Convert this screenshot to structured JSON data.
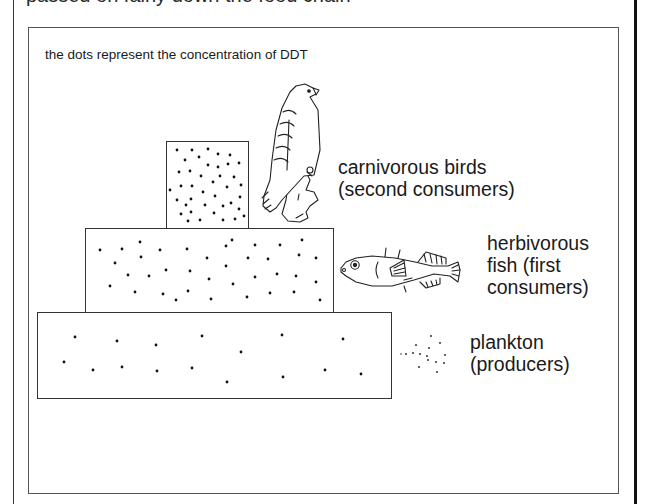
{
  "header": {
    "clipped_text": "passed on fairly down the food chain"
  },
  "diagram": {
    "caption": "the dots represent the concentration of DDT",
    "levels": [
      {
        "id": "carnivorous-birds",
        "label_line1": "carnivorous birds",
        "label_line2": "(second consumers)",
        "label_line3": "",
        "organism_icon": "bird-icon",
        "dot_count": 40,
        "box": {
          "x": 166,
          "y": 141,
          "w": 83,
          "h": 88
        }
      },
      {
        "id": "herbivorous-fish",
        "label_line1": "herbivorous",
        "label_line2": "fish (first",
        "label_line3": "consumers)",
        "organism_icon": "fish-icon",
        "dot_count": 38,
        "box": {
          "x": 85,
          "y": 228,
          "w": 249,
          "h": 85
        }
      },
      {
        "id": "plankton",
        "label_line1": "plankton",
        "label_line2": "(producers)",
        "label_line3": "",
        "organism_icon": "plankton-icon",
        "dot_count": 16,
        "box": {
          "x": 37,
          "y": 312,
          "w": 355,
          "h": 87
        }
      }
    ]
  },
  "colors": {
    "line": "#333333",
    "text": "#1a1a1a",
    "background": "#ffffff"
  }
}
